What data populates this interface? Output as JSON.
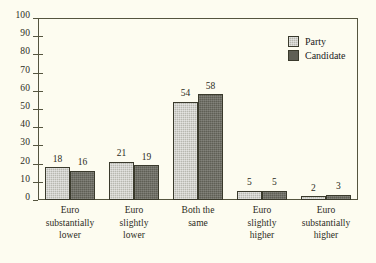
{
  "chart_data": {
    "type": "bar",
    "title": "",
    "subtitle": "",
    "xlabel": "",
    "ylabel": "",
    "ylim": [
      0,
      100
    ],
    "yticks": [
      0,
      10,
      20,
      30,
      40,
      50,
      60,
      70,
      80,
      90,
      100
    ],
    "grid": false,
    "legend_position": "top-right",
    "categories": [
      [
        "Euro",
        "substantially",
        "lower"
      ],
      [
        "Euro",
        "slightly",
        "lower"
      ],
      [
        "Both the",
        "same"
      ],
      [
        "Euro",
        "slightly",
        "higher"
      ],
      [
        "Euro",
        "substantially",
        "higher"
      ]
    ],
    "series": [
      {
        "name": "Party",
        "color": "#b8b8b0",
        "values": [
          18,
          21,
          54,
          5,
          2
        ]
      },
      {
        "name": "Candidate",
        "color": "#5f5f55",
        "values": [
          16,
          19,
          58,
          5,
          3
        ]
      }
    ]
  },
  "legend": {
    "items": [
      {
        "label": "Party",
        "swatch": "party"
      },
      {
        "label": "Candidate",
        "swatch": "candidate"
      }
    ]
  },
  "colors": {
    "background": "#fdfcf0",
    "axis": "#55553f",
    "text": "#2b2b22",
    "party": "#b8b8b0",
    "candidate": "#5f5f55"
  }
}
